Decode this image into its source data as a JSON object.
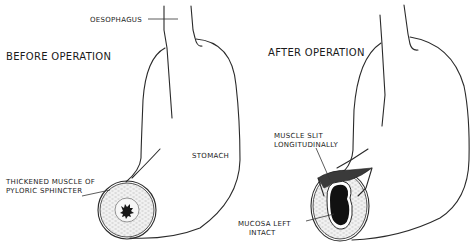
{
  "figure": {
    "panels": [
      {
        "title": "BEFORE OPERATION",
        "labels": {
          "oesophagus": "OESOPHAGUS",
          "stomach": "STOMACH",
          "pylorus_line1": "THICKENED MUSCLE OF",
          "pylorus_line2": "PYLORIC SPHINCTER"
        }
      },
      {
        "title": "AFTER OPERATION",
        "labels": {
          "slit_line1": "MUSCLE SLIT",
          "slit_line2": "LONGITUDINALLY",
          "mucosa_line1": "MUCOSA LEFT",
          "mucosa_line2": "INTACT"
        }
      }
    ],
    "colors": {
      "line": "#2a2a2a",
      "mucosa": "#111111",
      "muscle_fill": "#e8e8e8",
      "background": "#ffffff"
    }
  }
}
